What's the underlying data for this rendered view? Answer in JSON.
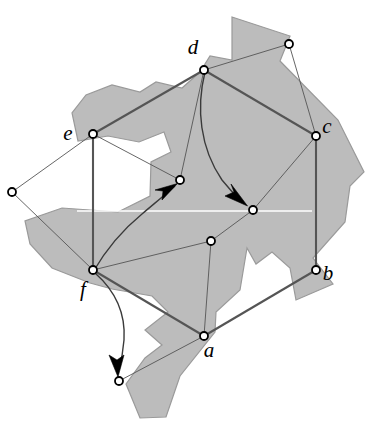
{
  "figure": {
    "type": "geometric-graph-diagram",
    "title": "",
    "background_color": "#ffffff",
    "region_fill_color": "#bcbcbc",
    "region_stroke_color": "#9a9a9a",
    "edge_color": "#555555",
    "node_stroke_color": "#000000",
    "node_fill_color": "#ffffff",
    "arrow_color": "#000000",
    "width": 368,
    "height": 427
  },
  "nodes": [
    {
      "id": "d",
      "label": "d",
      "x": 204,
      "y": 70,
      "label_x": 193,
      "label_y": 54,
      "labeled": true
    },
    {
      "id": "c",
      "label": "c",
      "x": 316,
      "y": 136,
      "label_x": 327,
      "label_y": 133,
      "labeled": true
    },
    {
      "id": "b",
      "label": "b",
      "x": 316,
      "y": 270,
      "label_x": 328,
      "label_y": 280,
      "labeled": true
    },
    {
      "id": "a",
      "label": "a",
      "x": 204,
      "y": 336,
      "label_x": 209,
      "label_y": 357,
      "labeled": true
    },
    {
      "id": "f",
      "label": "f",
      "x": 93,
      "y": 270,
      "label_x": 83,
      "label_y": 296,
      "labeled": true
    },
    {
      "id": "e",
      "label": "e",
      "x": 93,
      "y": 134,
      "label_x": 68,
      "label_y": 140,
      "labeled": true
    },
    {
      "id": "n1",
      "label": "",
      "x": 289,
      "y": 44,
      "label_x": 0,
      "label_y": 0,
      "labeled": false
    },
    {
      "id": "n2",
      "label": "",
      "x": 253,
      "y": 210,
      "label_x": 0,
      "label_y": 0,
      "labeled": false
    },
    {
      "id": "n3",
      "label": "",
      "x": 211,
      "y": 241,
      "label_x": 0,
      "label_y": 0,
      "labeled": false
    },
    {
      "id": "n4",
      "label": "",
      "x": 180,
      "y": 180,
      "label_x": 0,
      "label_y": 0,
      "labeled": false
    },
    {
      "id": "n5",
      "label": "",
      "x": 12,
      "y": 192,
      "label_x": 0,
      "label_y": 0,
      "labeled": false
    },
    {
      "id": "n6",
      "label": "",
      "x": 119,
      "y": 381,
      "label_x": 0,
      "label_y": 0,
      "labeled": false
    }
  ],
  "edges": [
    {
      "from": "e",
      "to": "d",
      "weight": "thick"
    },
    {
      "from": "d",
      "to": "c",
      "weight": "thick"
    },
    {
      "from": "c",
      "to": "b",
      "weight": "thick"
    },
    {
      "from": "b",
      "to": "a",
      "weight": "thick"
    },
    {
      "from": "a",
      "to": "f",
      "weight": "thick"
    },
    {
      "from": "f",
      "to": "e",
      "weight": "thick"
    },
    {
      "from": "d",
      "to": "n1",
      "weight": "thin"
    },
    {
      "from": "n1",
      "to": "c",
      "weight": "thin"
    },
    {
      "from": "c",
      "to": "n2",
      "weight": "thin"
    },
    {
      "from": "n2",
      "to": "n3",
      "weight": "thin"
    },
    {
      "from": "n3",
      "to": "a",
      "weight": "thin"
    },
    {
      "from": "a",
      "to": "n6",
      "weight": "thin"
    },
    {
      "from": "e",
      "to": "n5",
      "weight": "thin"
    },
    {
      "from": "n5",
      "to": "f",
      "weight": "thin"
    },
    {
      "from": "e",
      "to": "n4",
      "weight": "thin"
    },
    {
      "from": "n4",
      "to": "d",
      "weight": "thin"
    },
    {
      "from": "f",
      "to": "n3",
      "weight": "thin"
    }
  ],
  "arrows": [
    {
      "id": "arrow-f-to-n4",
      "from": "f",
      "to": "n4",
      "description": "curved arrow from f up-right to interior node n4"
    },
    {
      "id": "arrow-d-to-n2",
      "from": "d",
      "to": "n2",
      "description": "curved arrow from d down-right to interior node n2"
    },
    {
      "id": "arrow-f-to-n6",
      "from": "f",
      "to": "n6",
      "description": "curved arrow from f down to bottom node n6"
    }
  ],
  "region": {
    "name": "shaded-polygon",
    "description": "irregular shaded polygonal region (simple polygon with reflex vertices)",
    "outer_path": "M 232,17 L 290,36 L 280,61 L 338,120 L 364,172 L 350,186 L 345,222 L 313,258 L 333,284 L 296,300 L 290,268 L 272,252 L 256,264 L 247,248 L 240,290 L 216,312 L 215,332 L 180,376 L 166,417 L 140,418 L 126,384 L 145,358 L 162,345 L 145,330 L 168,312 L 152,296 L 112,289 L 90,283 L 52,268 L 30,244 L 25,221 L 62,208 L 118,212 L 150,196 L 151,162 L 171,152 L 164,132 L 139,142 L 108,136 L 78,141 L 72,113 L 86,95 L 112,85 L 140,92 L 156,82 L 182,88 L 200,72 L 210,56 L 232,60 Z"
  },
  "white_line": {
    "name": "horizontal-white-line",
    "x1": 77,
    "y1": 211,
    "x2": 312,
    "y2": 211,
    "color": "#ffffff"
  }
}
